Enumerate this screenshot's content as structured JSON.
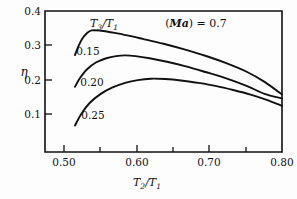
{
  "chart_data": {
    "type": "line",
    "title": "",
    "xlabel": "T2/T1",
    "ylabel": "eta",
    "xlim": [
      0.46,
      0.8
    ],
    "ylim": [
      0.0,
      0.4
    ],
    "grid": false,
    "legend_position": "inline-curve-labels",
    "x_ticks_major": [
      0.5,
      0.6,
      0.7,
      0.8
    ],
    "x_ticklabels": [
      "0.50",
      "0.60",
      "0.70",
      "0.80"
    ],
    "x_ticks_minor": [
      0.55,
      0.65,
      0.75
    ],
    "y_ticks_major": [
      0.1,
      0.2,
      0.3,
      0.4
    ],
    "y_ticklabels": [
      "0.1",
      "0.2",
      "0.3",
      "0.4"
    ],
    "series": [
      {
        "name": "0.15",
        "label": "0.15",
        "x": [
          0.503,
          0.508,
          0.513,
          0.52,
          0.527,
          0.54,
          0.56,
          0.58,
          0.6,
          0.63,
          0.66,
          0.69,
          0.72,
          0.75,
          0.775,
          0.8
        ],
        "values": [
          0.275,
          0.3,
          0.32,
          0.337,
          0.345,
          0.344,
          0.338,
          0.33,
          0.321,
          0.307,
          0.291,
          0.273,
          0.252,
          0.227,
          0.199,
          0.163
        ]
      },
      {
        "name": "0.20",
        "label": "0.20",
        "x": [
          0.503,
          0.51,
          0.52,
          0.533,
          0.548,
          0.562,
          0.575,
          0.59,
          0.61,
          0.635,
          0.662,
          0.69,
          0.72,
          0.75,
          0.775,
          0.8
        ],
        "values": [
          0.185,
          0.209,
          0.234,
          0.254,
          0.266,
          0.272,
          0.274,
          0.272,
          0.266,
          0.256,
          0.243,
          0.227,
          0.209,
          0.187,
          0.165,
          0.152
        ]
      },
      {
        "name": "0.25",
        "label": "0.25",
        "x": [
          0.503,
          0.512,
          0.524,
          0.54,
          0.557,
          0.575,
          0.593,
          0.612,
          0.632,
          0.655,
          0.68,
          0.706,
          0.73,
          0.755,
          0.778,
          0.8
        ],
        "values": [
          0.075,
          0.108,
          0.139,
          0.165,
          0.183,
          0.196,
          0.204,
          0.208,
          0.207,
          0.203,
          0.196,
          0.187,
          0.176,
          0.163,
          0.148,
          0.131
        ]
      }
    ],
    "annotations": [
      {
        "id": "series-key-title",
        "text_main": "T",
        "sub1": "3",
        "divider": "/",
        "text_second": "T",
        "sub2": "1"
      },
      {
        "id": "mach-annotation",
        "text": "(Ma) = 0.7",
        "ma_italic": "Ma",
        "rest": ") = 0.7",
        "open": "("
      }
    ],
    "colors": {
      "line": "#111111",
      "axis": "#111111",
      "background": "#fdfdfd"
    }
  },
  "labels": {
    "y_axis_symbol": "η",
    "x_axis_num": "T",
    "x_axis_num_sub": "2",
    "x_axis_den": "T",
    "x_axis_den_sub": "1",
    "slash": "/",
    "key_num": "T",
    "key_num_sub": "3",
    "key_den": "T",
    "key_den_sub": "1",
    "mach_open": "(",
    "mach_symbol": "Ma",
    "mach_rest": ") = 0.7",
    "curve_label_1": "0.15",
    "curve_label_2": "0.20",
    "curve_label_3": "0.25",
    "xtick_1": "0.50",
    "xtick_2": "0.60",
    "xtick_3": "0.70",
    "xtick_4": "0.80",
    "ytick_1": "0.1",
    "ytick_2": "0.2",
    "ytick_3": "0.3",
    "ytick_4": "0.4"
  }
}
